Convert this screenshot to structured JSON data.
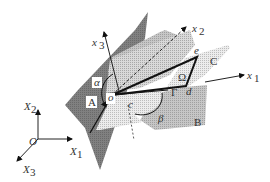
{
  "figure": {
    "colors": {
      "plane_A": "#7a7a7a",
      "plane_B": "#bdbdbd",
      "plane_C": "#d8d8d8",
      "plane_upper": "#b0b0b0",
      "region_lower": "#e4e4e4",
      "lines": "#111111",
      "background": "#ffffff"
    },
    "local_axes": {
      "x1": "x",
      "x1_sub": "1",
      "x2": "x",
      "x2_sub": "2",
      "x3": "x",
      "x3_sub": "3",
      "origin": "o"
    },
    "global_axes": {
      "X1": "X",
      "X1_sub": "1",
      "X2": "X",
      "X2_sub": "2",
      "X3": "X",
      "X3_sub": "3",
      "origin": "O"
    },
    "plane_labels": {
      "A": "A",
      "B": "B",
      "C": "C"
    },
    "angle_labels": {
      "alpha": "α",
      "beta": "β"
    },
    "region_labels": {
      "omega": "Ω",
      "gamma": "Γ"
    },
    "point_labels": {
      "c": "c",
      "d": "d",
      "e": "e"
    }
  }
}
